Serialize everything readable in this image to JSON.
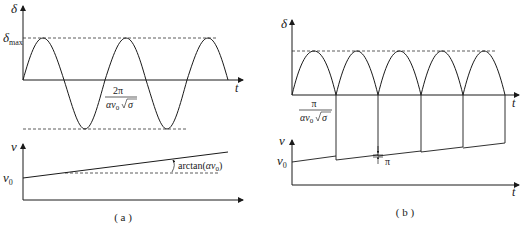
{
  "panel_a": {
    "caption": "( a )",
    "top": {
      "y_label": "δ",
      "x_label": "t",
      "ymax_label_main": "δ",
      "ymax_label_sub": "max",
      "period_numerator": "2π",
      "period_denominator_main": "αv",
      "period_denominator_sub": "0",
      "period_denominator_root": "σ"
    },
    "bottom": {
      "y_label": "v",
      "y0_label_main": "v",
      "y0_label_sub": "0",
      "slope_label_prefix": "arctan(",
      "slope_label_alpha": "αv",
      "slope_label_sub": "0",
      "slope_label_suffix": ")"
    }
  },
  "panel_b": {
    "caption": "( b )",
    "top": {
      "y_label": "δ",
      "x_label": "t",
      "period_numerator": "π",
      "period_denominator_main": "αv",
      "period_denominator_sub": "0",
      "period_denominator_root": "σ"
    },
    "bottom": {
      "y_label": "v",
      "x_label": "t",
      "y0_label_main": "v",
      "y0_label_sub": "0",
      "jump_label": "π"
    }
  },
  "colors": {
    "line": "#1a1a1a",
    "dashed": "#333333",
    "background": "#ffffff"
  }
}
